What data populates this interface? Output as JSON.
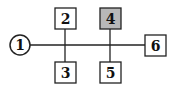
{
  "diagram": {
    "colors": {
      "stroke": "#222222",
      "highlight_fill": "#b8b8b8",
      "fill": "#ffffff"
    },
    "nodes": [
      {
        "id": "1",
        "label": "1",
        "shape": "circle"
      },
      {
        "id": "2",
        "label": "2",
        "shape": "box"
      },
      {
        "id": "3",
        "label": "3",
        "shape": "box"
      },
      {
        "id": "4",
        "label": "4",
        "shape": "box",
        "highlighted": true
      },
      {
        "id": "5",
        "label": "5",
        "shape": "box"
      },
      {
        "id": "6",
        "label": "6",
        "shape": "box"
      }
    ],
    "edges": [
      {
        "from": "1",
        "to": "6"
      },
      {
        "from": "2",
        "to": "3"
      },
      {
        "from": "4",
        "to": "5"
      }
    ]
  }
}
